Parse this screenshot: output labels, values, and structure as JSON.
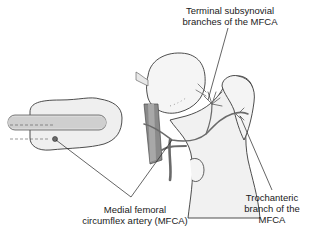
{
  "figure": {
    "colors": {
      "bone_fill": "#ececec",
      "bone_outline": "#3a3a3a",
      "artery": "#6a6a6a",
      "leader_line": "#222222",
      "text": "#1a1a1a"
    }
  },
  "labels": {
    "terminal_branches": {
      "line1": "Terminal subsynovial",
      "line2": "branches of the MFCA"
    },
    "mfca": {
      "line1": "Medial femoral",
      "line2": "circumflex artery (MFCA)"
    },
    "trochanteric_branch": {
      "line1": "Trochanteric",
      "line2": "branch of the",
      "line3": "MFCA"
    }
  }
}
